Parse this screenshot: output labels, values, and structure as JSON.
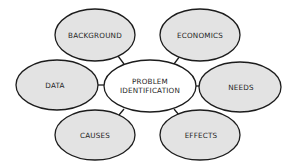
{
  "diagram": {
    "type": "mind-map",
    "colors": {
      "background": "#ffffff",
      "outer_fill": "#e3e3e3",
      "center_fill": "#ffffff",
      "stroke": "#1c1c1c",
      "text": "#1e1e1e"
    },
    "center": {
      "label_line1": "PROBLEM",
      "label_line2": "IDENTIFICATION"
    },
    "nodes": [
      {
        "id": "background",
        "label": "BACKGROUND"
      },
      {
        "id": "economics",
        "label": "ECONOMICS"
      },
      {
        "id": "data",
        "label": "DATA"
      },
      {
        "id": "needs",
        "label": "NEEDS"
      },
      {
        "id": "causes",
        "label": "CAUSES"
      },
      {
        "id": "effects",
        "label": "EFFECTS"
      }
    ],
    "edges": [
      {
        "from": "problem-identification",
        "to": "background"
      },
      {
        "from": "problem-identification",
        "to": "economics"
      },
      {
        "from": "problem-identification",
        "to": "data"
      },
      {
        "from": "problem-identification",
        "to": "needs"
      },
      {
        "from": "problem-identification",
        "to": "causes"
      },
      {
        "from": "problem-identification",
        "to": "effects"
      }
    ]
  }
}
